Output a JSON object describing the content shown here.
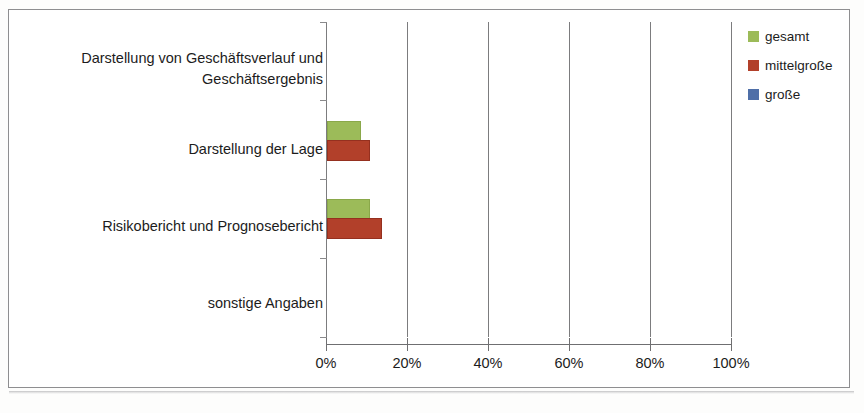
{
  "chart_data": {
    "type": "bar",
    "orientation": "horizontal",
    "title": "",
    "xlabel": "",
    "ylabel": "",
    "xlim": [
      0,
      100
    ],
    "xticks": [
      0,
      20,
      40,
      60,
      80,
      100
    ],
    "xtick_labels": [
      "0%",
      "20%",
      "40%",
      "60%",
      "80%",
      "100%"
    ],
    "grid": true,
    "grid_axis": "x",
    "legend_position": "top-right",
    "categories": [
      "Darstellung von Geschäftsverlauf und Geschäftsergebnis",
      "Darstellung der Lage",
      "Risikobericht und Prognosebericht",
      "sonstige Angaben"
    ],
    "series": [
      {
        "name": "gesamt",
        "color": "#9cbb59",
        "values": [
          0,
          8,
          10,
          0
        ]
      },
      {
        "name": "mittelgroße",
        "color": "#b2402a",
        "values": [
          0,
          10,
          13,
          0
        ]
      },
      {
        "name": "große",
        "color": "#4f6fa8",
        "values": [
          0,
          0,
          0,
          0
        ]
      }
    ]
  },
  "legend": {
    "items": [
      {
        "label": "gesamt"
      },
      {
        "label": "mittelgroße"
      },
      {
        "label": "große"
      }
    ]
  },
  "axis": {
    "ticks": [
      {
        "label": "0%"
      },
      {
        "label": "20%"
      },
      {
        "label": "40%"
      },
      {
        "label": "60%"
      },
      {
        "label": "80%"
      },
      {
        "label": "100%"
      }
    ]
  },
  "categories": [
    {
      "line1": "Darstellung von Geschäftsverlauf und",
      "line2": "Geschäftsergebnis"
    },
    {
      "line1": "Darstellung der Lage",
      "line2": ""
    },
    {
      "line1": "Risikobericht und Prognosebericht",
      "line2": ""
    },
    {
      "line1": "sonstige Angaben",
      "line2": ""
    }
  ]
}
